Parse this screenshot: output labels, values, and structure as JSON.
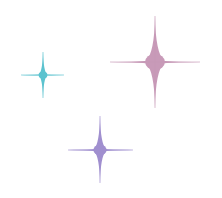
{
  "background": "#ffffff",
  "sparkles": [
    {
      "name": "teal-sparkle",
      "color": "#5cc3cf",
      "center": [
        43,
        75
      ],
      "left": 21,
      "right": 64,
      "top": 52,
      "bottom": 98,
      "core": 4
    },
    {
      "name": "pink-sparkle",
      "color": "#c89ab8",
      "center": [
        155,
        62
      ],
      "left": 110,
      "right": 200,
      "top": 16,
      "bottom": 108,
      "core": 9
    },
    {
      "name": "purple-sparkle",
      "color": "#a08fcf",
      "center": [
        100,
        150
      ],
      "left": 68,
      "right": 133,
      "top": 116,
      "bottom": 183,
      "core": 6
    }
  ]
}
